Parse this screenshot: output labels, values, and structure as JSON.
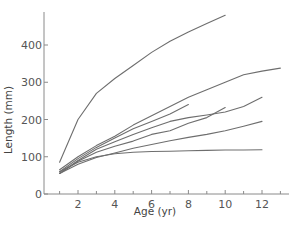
{
  "chart_data": {
    "type": "line",
    "title": "",
    "xlabel": "Age (yr)",
    "ylabel": "Length (mm)",
    "xlim": [
      0.3,
      13.3
    ],
    "ylim": [
      0,
      490
    ],
    "x_ticks": [
      2,
      4,
      6,
      8,
      10,
      12
    ],
    "x_minor_ticks": [
      1,
      3,
      5,
      7,
      9,
      11,
      13
    ],
    "y_ticks": [
      0,
      100,
      200,
      300,
      400
    ],
    "grid": false,
    "legend": "none",
    "line_color": "#6e6e6e",
    "series": [
      {
        "name": "curve-1",
        "x": [
          1,
          2,
          3,
          4,
          5,
          6,
          7,
          8,
          9,
          10
        ],
        "values": [
          85,
          200,
          270,
          310,
          345,
          380,
          410,
          435,
          458,
          480
        ]
      },
      {
        "name": "curve-2",
        "x": [
          1,
          2,
          3,
          4,
          5,
          6,
          7,
          8,
          9,
          10,
          11,
          12,
          13
        ],
        "values": [
          65,
          100,
          130,
          155,
          185,
          210,
          235,
          260,
          280,
          300,
          320,
          330,
          338
        ]
      },
      {
        "name": "curve-3",
        "x": [
          1,
          2,
          3,
          4,
          5,
          6,
          7,
          8
        ],
        "values": [
          60,
          95,
          125,
          150,
          175,
          195,
          215,
          240
        ]
      },
      {
        "name": "curve-4",
        "x": [
          1,
          2,
          3,
          4,
          5,
          6,
          7,
          8,
          9,
          10,
          11,
          12
        ],
        "values": [
          55,
          90,
          120,
          140,
          160,
          178,
          195,
          205,
          212,
          220,
          235,
          260
        ]
      },
      {
        "name": "curve-5",
        "x": [
          1,
          2,
          3,
          4,
          5,
          6,
          7,
          8,
          9,
          10
        ],
        "values": [
          55,
          88,
          112,
          128,
          142,
          160,
          170,
          190,
          205,
          232
        ]
      },
      {
        "name": "curve-6",
        "x": [
          1,
          2,
          3,
          4,
          5,
          6,
          7,
          8,
          9,
          10,
          11,
          12
        ],
        "values": [
          55,
          80,
          98,
          110,
          123,
          133,
          143,
          152,
          160,
          170,
          182,
          195
        ]
      },
      {
        "name": "curve-7",
        "x": [
          1,
          2,
          3,
          4,
          5,
          6,
          7,
          8,
          9,
          10,
          11,
          12
        ],
        "values": [
          60,
          85,
          100,
          108,
          112,
          114,
          115,
          116,
          117,
          118,
          118,
          119
        ]
      }
    ]
  }
}
